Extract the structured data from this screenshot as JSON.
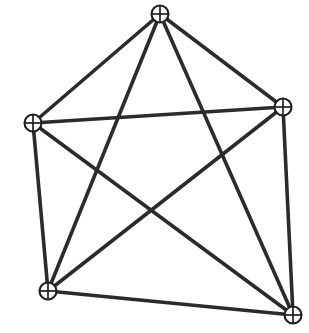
{
  "figure": {
    "kind": "graph-diagram",
    "background_color": "#ffffff",
    "edge_color": "#2b2b2b",
    "vertex_stroke_color": "#1f1f1f",
    "vertex_fill_color": "#ffffff",
    "edge_stroke_width": 3.6,
    "vertex_radius": 8.5,
    "vertex_glyph": "circled-plus",
    "vertex_count": 5,
    "edge_count": 10,
    "canvas": {
      "width": 309,
      "height": 333
    }
  },
  "chart_data": {
    "type": "diagram",
    "graph_name": "K5",
    "title": "",
    "nodes": [
      {
        "id": "top",
        "label": "",
        "x": 160,
        "y": 14,
        "degree": 4,
        "icon": "circled-plus-icon"
      },
      {
        "id": "right",
        "label": "",
        "x": 283,
        "y": 107,
        "degree": 4,
        "icon": "circled-plus-icon"
      },
      {
        "id": "bottom-right",
        "label": "",
        "x": 293,
        "y": 315,
        "degree": 4,
        "icon": "circled-plus-icon"
      },
      {
        "id": "bottom-left",
        "label": "",
        "x": 48,
        "y": 291,
        "degree": 4,
        "icon": "circled-plus-icon"
      },
      {
        "id": "left",
        "label": "",
        "x": 33,
        "y": 123,
        "degree": 4,
        "icon": "circled-plus-icon"
      }
    ],
    "edges": [
      {
        "id": "e1",
        "from": "top",
        "to": "right",
        "kind": "outer"
      },
      {
        "id": "e2",
        "from": "right",
        "to": "bottom-right",
        "kind": "outer"
      },
      {
        "id": "e3",
        "from": "bottom-right",
        "to": "bottom-left",
        "kind": "outer"
      },
      {
        "id": "e4",
        "from": "bottom-left",
        "to": "left",
        "kind": "outer"
      },
      {
        "id": "e5",
        "from": "left",
        "to": "top",
        "kind": "outer"
      },
      {
        "id": "e6",
        "from": "top",
        "to": "bottom-right",
        "kind": "chord"
      },
      {
        "id": "e7",
        "from": "top",
        "to": "bottom-left",
        "kind": "chord"
      },
      {
        "id": "e8",
        "from": "right",
        "to": "bottom-left",
        "kind": "chord"
      },
      {
        "id": "e9",
        "from": "right",
        "to": "left",
        "kind": "chord"
      },
      {
        "id": "e10",
        "from": "bottom-right",
        "to": "left",
        "kind": "chord"
      }
    ]
  }
}
